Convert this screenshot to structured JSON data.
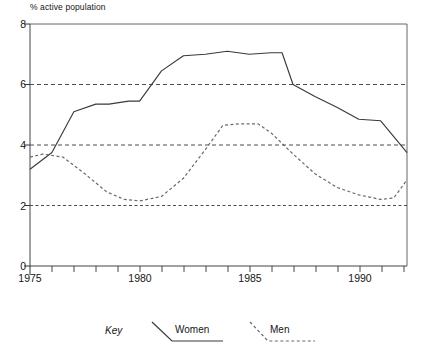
{
  "chart_data": {
    "type": "line",
    "title": "% active population",
    "xlabel": "",
    "ylabel": "% active population",
    "xlim": [
      1975,
      1992.2
    ],
    "ylim": [
      0,
      8
    ],
    "yticks": [
      0,
      2,
      4,
      6,
      8
    ],
    "xticks_labeled": [
      1975,
      1980,
      1985,
      1990
    ],
    "xtick_interval": 1,
    "grid": "horizontal dashed gridlines at 2, 4 and 6",
    "legend_position": "below plot",
    "legend_title": "Key",
    "series": [
      {
        "name": "Women",
        "style": "solid",
        "color": "#3a3a3a",
        "x": [
          1975,
          1976,
          1977,
          1978,
          1978.6,
          1979.5,
          1980,
          1981,
          1982,
          1983,
          1984,
          1985,
          1986,
          1986.5,
          1987,
          1988,
          1989,
          1990,
          1991,
          1992.2
        ],
        "values": [
          3.2,
          3.75,
          5.1,
          5.35,
          5.35,
          5.45,
          5.45,
          6.45,
          6.95,
          7.0,
          7.1,
          7.0,
          7.05,
          7.05,
          6.0,
          5.6,
          5.25,
          4.85,
          4.8,
          3.75
        ]
      },
      {
        "name": "Men",
        "style": "dashed",
        "color": "#6a6a6a",
        "x": [
          1975,
          1975.6,
          1976.5,
          1977.5,
          1978.5,
          1979.3,
          1980,
          1981,
          1982,
          1983,
          1983.8,
          1984.6,
          1985.4,
          1986,
          1987,
          1988,
          1989,
          1990,
          1991,
          1991.6,
          1992.2
        ],
        "values": [
          3.6,
          3.7,
          3.6,
          3.05,
          2.45,
          2.2,
          2.15,
          2.3,
          2.9,
          3.85,
          4.65,
          4.7,
          4.7,
          4.4,
          3.7,
          3.05,
          2.6,
          2.35,
          2.2,
          2.25,
          2.85
        ]
      }
    ]
  },
  "legend": {
    "key_label": "Key",
    "women_label": "Women",
    "men_label": "Men"
  },
  "axes": {
    "ytick_labels": [
      "8",
      "6",
      "4",
      "2",
      "0"
    ],
    "xtick_labels": [
      "1975",
      "1980",
      "1985",
      "1990"
    ]
  }
}
